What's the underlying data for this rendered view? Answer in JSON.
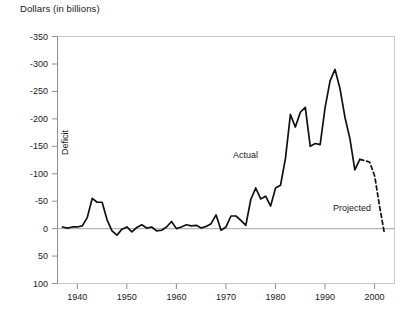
{
  "chart_data": {
    "type": "line",
    "title": "Dollars (in billions)",
    "xlabel": "",
    "ylabel": "Deficit",
    "ylim": [
      -350,
      100
    ],
    "xlim": [
      1936,
      2004
    ],
    "y_inverted": true,
    "grid": false,
    "legend_position": "inline-annotation",
    "y_ticks": [
      -350,
      -300,
      -250,
      -200,
      -150,
      -100,
      -50,
      0,
      50,
      100
    ],
    "y_tick_labels": [
      "-350",
      "-300",
      "-250",
      "-200",
      "-150",
      "-100",
      "-50",
      "0",
      "50",
      "100"
    ],
    "x_ticks": [
      1940,
      1950,
      1960,
      1970,
      1980,
      1990,
      2000
    ],
    "x_tick_labels": [
      "1940",
      "1950",
      "1960",
      "1970",
      "1980",
      "1990",
      "2000"
    ],
    "annotations": [
      {
        "text": "Actual",
        "x": 1979.0,
        "y": -108
      },
      {
        "text": "Projected",
        "x": 1996.5,
        "y": -40
      },
      {
        "text": "Deficit",
        "x": 1940.5,
        "y": -185,
        "rotation": -90
      }
    ],
    "series": [
      {
        "name": "Actual",
        "style": "solid",
        "color": "#111111",
        "x": [
          1937,
          1938,
          1939,
          1940,
          1941,
          1942,
          1943,
          1944,
          1945,
          1946,
          1947,
          1948,
          1949,
          1950,
          1951,
          1952,
          1953,
          1954,
          1955,
          1956,
          1957,
          1958,
          1959,
          1960,
          1961,
          1962,
          1963,
          1964,
          1965,
          1966,
          1967,
          1968,
          1969,
          1970,
          1971,
          1972,
          1973,
          1974,
          1975,
          1976,
          1977,
          1978,
          1979,
          1980,
          1981,
          1982,
          1983,
          1984,
          1985,
          1986,
          1987,
          1988,
          1989,
          1990,
          1991,
          1992,
          1993,
          1994,
          1995,
          1996,
          1997
        ],
        "values": [
          -3,
          -1,
          -3,
          -3,
          -5,
          -20,
          -55,
          -48,
          -48,
          -16,
          4,
          12,
          1,
          -3,
          6,
          -2,
          -7,
          -1,
          -3,
          4,
          3,
          -3,
          -13,
          0,
          -3,
          -7,
          -5,
          -6,
          -1,
          -4,
          -9,
          -25,
          3,
          -3,
          -23,
          -23,
          -15,
          -6,
          -53,
          -74,
          -54,
          -59,
          -41,
          -74,
          -79,
          -128,
          -208,
          -185,
          -212,
          -221,
          -150,
          -155,
          -153,
          -221,
          -269,
          -290,
          -255,
          -203,
          -164,
          -107,
          -126
        ],
        "unit": "billions of dollars"
      },
      {
        "name": "Projected",
        "style": "dashed",
        "color": "#111111",
        "x": [
          1997,
          1998,
          1999,
          2000,
          2001,
          2002
        ],
        "values": [
          -126,
          -124,
          -121,
          -96,
          -40,
          10
        ],
        "unit": "billions of dollars"
      }
    ]
  },
  "labels": {
    "actual": "Actual",
    "projected": "Projected",
    "deficit": "Deficit",
    "y_axis_title": "Dollars (in billions)"
  }
}
